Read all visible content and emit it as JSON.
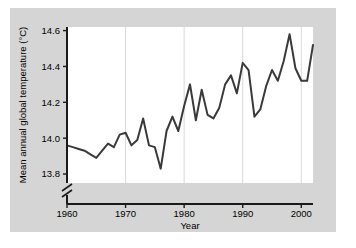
{
  "figure": {
    "background_color": "#d5d5d5",
    "plot_background_color": "#ffffff",
    "line_color": "#3a3a3a",
    "axis_color": "#1a1a1a",
    "gridline_color": "#d9d9d9"
  },
  "axes": {
    "y_title": "Mean annual global temperature (°C)",
    "x_title": "Year",
    "y_ticks": [
      "13.8",
      "14.0",
      "14.2",
      "14.4",
      "14.6"
    ],
    "x_ticks": [
      "1960",
      "1970",
      "1980",
      "1990",
      "2000"
    ],
    "axis_break": "broken-axis-marker"
  },
  "chart_data": {
    "type": "line",
    "title": "",
    "xlabel": "Year",
    "ylabel": "Mean annual global temperature (°C)",
    "xlim": [
      1960,
      2002
    ],
    "ylim": [
      13.75,
      14.62
    ],
    "ytick_values": [
      13.8,
      14.0,
      14.2,
      14.4,
      14.6
    ],
    "xtick_values": [
      1960,
      1970,
      1980,
      1990,
      2000
    ],
    "grid": "vertical-only",
    "legend": "none",
    "axis_break_below": 13.8,
    "series": [
      {
        "name": "Mean annual global temperature",
        "x": [
          1960,
          1961,
          1962,
          1963,
          1964,
          1965,
          1966,
          1967,
          1968,
          1969,
          1970,
          1971,
          1972,
          1973,
          1974,
          1975,
          1976,
          1977,
          1978,
          1979,
          1980,
          1981,
          1982,
          1983,
          1984,
          1985,
          1986,
          1987,
          1988,
          1989,
          1990,
          1991,
          1992,
          1993,
          1994,
          1995,
          1996,
          1997,
          1998,
          1999,
          2000,
          2001,
          2002
        ],
        "values": [
          13.96,
          13.95,
          13.94,
          13.93,
          13.91,
          13.89,
          13.93,
          13.97,
          13.95,
          14.02,
          14.03,
          13.96,
          13.99,
          14.11,
          13.96,
          13.95,
          13.83,
          14.04,
          14.12,
          14.04,
          14.18,
          14.3,
          14.1,
          14.27,
          14.13,
          14.11,
          14.17,
          14.3,
          14.35,
          14.25,
          14.42,
          14.38,
          14.12,
          14.16,
          14.29,
          14.38,
          14.32,
          14.43,
          14.58,
          14.39,
          14.32,
          14.32,
          14.52
        ]
      }
    ]
  }
}
